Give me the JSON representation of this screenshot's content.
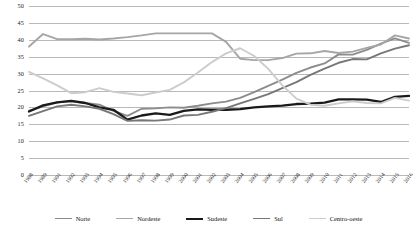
{
  "chart_data": {
    "type": "line",
    "title": "",
    "subtitle": "",
    "xlabel": "",
    "ylabel": "",
    "ylim": [
      0,
      50
    ],
    "yticks": [
      0,
      5,
      10,
      15,
      20,
      25,
      30,
      35,
      40,
      45,
      50
    ],
    "grid": true,
    "legend_position": "bottom",
    "x": [
      "1988",
      "1989",
      "1991",
      "1992",
      "1993",
      "1994",
      "1995",
      "1996",
      "1997",
      "1998",
      "1999",
      "2000",
      "2001",
      "2002",
      "2003",
      "2004",
      "2005",
      "2006",
      "2007",
      "2008",
      "2009",
      "2010",
      "2011",
      "2012",
      "2013",
      "2014",
      "2015",
      "2016"
    ],
    "series": [
      {
        "name": "Norte",
        "color": "#8c8c8c",
        "width": 1.9,
        "values": [
          19.0,
          20.3,
          21.5,
          21.8,
          21.3,
          20.8,
          19.0,
          17.5,
          19.6,
          19.7,
          20.0,
          19.9,
          20.5,
          21.2,
          21.7,
          22.8,
          24.5,
          26.4,
          28.2,
          30.2,
          31.8,
          33.0,
          35.7,
          35.6,
          37.0,
          38.9,
          40.4,
          39.1
        ]
      },
      {
        "name": "Nordeste",
        "color": "#a6a6a6",
        "width": 1.9,
        "values": [
          38.0,
          41.7,
          40.2,
          40.2,
          40.3,
          40.1,
          40.4,
          40.8,
          41.3,
          41.9,
          41.9,
          41.9,
          41.9,
          41.9,
          39.4,
          34.4,
          34.0,
          34.0,
          34.6,
          35.9,
          36.0,
          36.7,
          36.1,
          36.5,
          37.6,
          38.6,
          41.3,
          40.4
        ]
      },
      {
        "name": "Sudeste",
        "color": "#1a1a1a",
        "width": 2.3,
        "values": [
          18.8,
          20.6,
          21.5,
          21.9,
          21.3,
          20.0,
          19.3,
          16.4,
          17.6,
          18.2,
          17.8,
          19.0,
          19.4,
          19.3,
          19.3,
          19.5,
          20.0,
          20.3,
          20.5,
          21.0,
          21.1,
          21.4,
          22.4,
          22.4,
          22.3,
          21.6,
          23.1,
          23.4
        ]
      },
      {
        "name": "Sul",
        "color": "#777777",
        "width": 1.9,
        "values": [
          17.5,
          18.9,
          20.3,
          20.8,
          20.3,
          19.6,
          18.0,
          16.0,
          16.2,
          16.1,
          16.4,
          17.6,
          17.8,
          18.7,
          19.8,
          21.2,
          22.5,
          23.9,
          25.7,
          27.5,
          29.6,
          31.5,
          33.2,
          34.3,
          34.2,
          36.0,
          37.4,
          38.4
        ]
      },
      {
        "name": "Centro-oeste",
        "color": "#cccccc",
        "width": 1.9,
        "values": [
          30.5,
          28.6,
          26.5,
          24.2,
          24.5,
          25.7,
          24.6,
          24.1,
          23.6,
          24.4,
          25.2,
          27.4,
          30.3,
          33.4,
          36.0,
          37.5,
          35.2,
          31.4,
          26.5,
          22.6,
          20.8,
          20.5,
          21.2,
          21.8,
          21.3,
          21.2,
          22.8,
          22.0
        ]
      }
    ]
  },
  "legend": {
    "items": [
      {
        "label": "Norte"
      },
      {
        "label": "Nordeste"
      },
      {
        "label": "Sudeste"
      },
      {
        "label": "Sul"
      },
      {
        "label": "Centro-oeste"
      }
    ]
  }
}
